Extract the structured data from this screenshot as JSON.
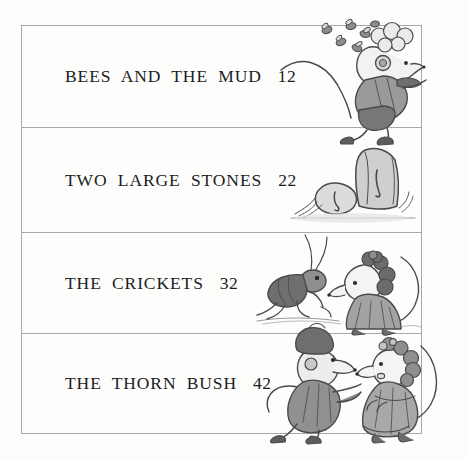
{
  "page": {
    "kind": "book-table-of-contents",
    "background_color": "#fdfdfc",
    "border_color": "#a8a8a8",
    "text_color": "#1c1c1c"
  },
  "contents": {
    "entries": [
      {
        "title": "BEES AND THE MUD",
        "page_number": "12",
        "illustration": "mouse-chased-by-bees"
      },
      {
        "title": "TWO LARGE STONES",
        "page_number": "22",
        "illustration": "two-stones-on-grass"
      },
      {
        "title": "THE CRICKETS",
        "page_number": "32",
        "illustration": "cricket-and-mouse-lady"
      },
      {
        "title": "THE THORN BUSH",
        "page_number": "42",
        "illustration": "two-mice-talking"
      }
    ]
  }
}
